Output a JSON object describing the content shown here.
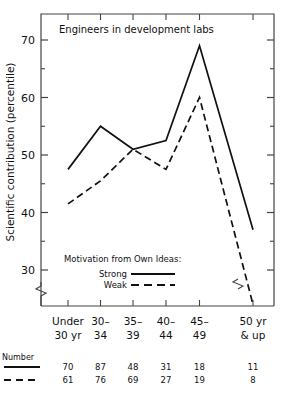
{
  "chart_data": {
    "type": "line",
    "title": "Engineers in development labs",
    "xlabel": "",
    "ylabel": "Scientific contribution (percentile)",
    "categories": [
      "Under 30 yr",
      "30-34",
      "35-39",
      "40-44",
      "45-49",
      "50 yr & up"
    ],
    "category_lines": [
      [
        "Under",
        "30 yr"
      ],
      [
        "30–",
        "34"
      ],
      [
        "35–",
        "39"
      ],
      [
        "40–",
        "44"
      ],
      [
        "45–",
        "49"
      ],
      [
        "50 yr",
        "& up"
      ]
    ],
    "series": [
      {
        "name": "Strong",
        "style": "solid",
        "values": [
          47.5,
          55,
          51,
          52.5,
          69,
          37
        ]
      },
      {
        "name": "Weak",
        "style": "dashed",
        "values": [
          41.5,
          45.5,
          51,
          47.5,
          60,
          24
        ]
      }
    ],
    "yticks": [
      30,
      40,
      50,
      60,
      70
    ],
    "ytick_labels": [
      "30",
      "40",
      "50",
      "60",
      "70"
    ],
    "yminor": [
      35,
      45,
      55,
      65
    ],
    "ylim": [
      22,
      74
    ],
    "axis_break": true,
    "grid": false,
    "legend_position": "inside-lower-center",
    "legend": {
      "heading": "Motivation from Own Ideas:",
      "entries": [
        {
          "label": "Strong",
          "style": "solid"
        },
        {
          "label": "Weak",
          "style": "dashed"
        }
      ]
    },
    "number_table": {
      "label": "Number",
      "rows": [
        {
          "style": "solid",
          "values": [
            "70",
            "87",
            "48",
            "31",
            "18",
            "11"
          ]
        },
        {
          "style": "dashed",
          "values": [
            "61",
            "76",
            "69",
            "27",
            "19",
            "8"
          ]
        }
      ]
    },
    "colors": {
      "line": "#111111",
      "axis": "#444444",
      "background": "#ffffff"
    }
  }
}
